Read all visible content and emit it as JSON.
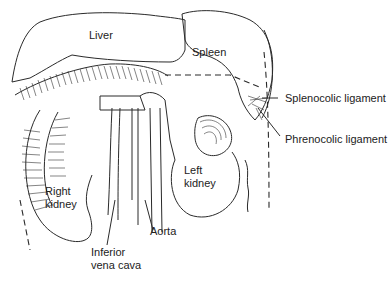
{
  "figure": {
    "labels": {
      "liver": "Liver",
      "spleen": "Spleen",
      "splenocolic": "Splenocolic ligament",
      "phrenocolic": "Phrenocolic ligament",
      "right_kidney_1": "Right",
      "right_kidney_2": "kidney",
      "left_kidney_1": "Left",
      "left_kidney_2": "kidney",
      "aorta": "Aorta",
      "ivc_1": "Inferior",
      "ivc_2": "vena cava"
    }
  }
}
